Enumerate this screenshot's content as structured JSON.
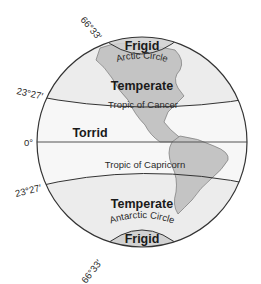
{
  "diagram": {
    "colors": {
      "frigid_fill": "#d2d2d2",
      "temperate_fill": "#ececec",
      "torrid_fill": "#f7f7f7",
      "land_fill": "#c4c4c4",
      "outline": "#333333"
    },
    "zones": {
      "north_frigid": "Frigid",
      "north_temperate": "Temperate",
      "torrid": "Torrid",
      "south_temperate": "Temperate",
      "south_frigid": "Frigid"
    },
    "lines": {
      "arctic_circle": "Arctic Circle",
      "tropic_of_cancer": "Tropic of Cancer",
      "equator": "",
      "tropic_of_capricorn": "Tropic of Capricorn",
      "antarctic_circle": "Antarctic Circle"
    },
    "latitudes": {
      "north_66": "66°33′",
      "north_23": "23°27′",
      "equator": "0°",
      "south_23": "23°27′",
      "south_66": "66°33′"
    }
  }
}
